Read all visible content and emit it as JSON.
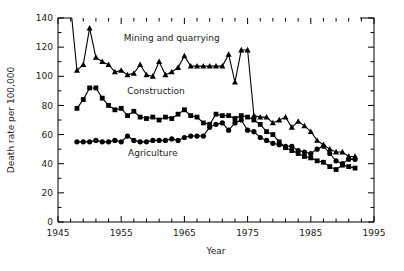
{
  "figure": {
    "background": "#ffffff",
    "ink": "#000000"
  },
  "chart_data": {
    "type": "line",
    "title": "",
    "subtitle": "",
    "xlabel": "Year",
    "ylabel": "Death rate per 100,000",
    "xlim": [
      1945,
      1995
    ],
    "ylim": [
      0,
      140
    ],
    "xticks": [
      1945,
      1955,
      1965,
      1975,
      1985,
      1995
    ],
    "xticklabels": [
      "1945",
      "1955",
      "1965",
      "1975",
      "1985",
      "1995"
    ],
    "yticks": [
      0,
      20,
      40,
      60,
      80,
      100,
      120,
      140
    ],
    "yticklabels": [
      "0",
      "20",
      "40",
      "60",
      "80",
      "100",
      "120",
      "140"
    ],
    "xminorticks": [
      1947,
      1949,
      1951,
      1953,
      1957,
      1959,
      1961,
      1963,
      1967,
      1969,
      1971,
      1973,
      1977,
      1979,
      1981,
      1983,
      1987,
      1989,
      1991,
      1993
    ],
    "yminorticks": [
      10,
      30,
      50,
      70,
      90,
      110,
      130
    ],
    "grid": false,
    "legend_position": "inline-annotations",
    "annotations": [
      {
        "text": "Mining and quarrying",
        "x": 1963.0,
        "y": 124.0
      },
      {
        "text": "Construction",
        "x": 1960.5,
        "y": 88.0
      },
      {
        "text": "Agriculture",
        "x": 1960.0,
        "y": 45.0
      }
    ],
    "series": [
      {
        "name": "Mining and quarrying",
        "marker": "triangle",
        "color": "#000000",
        "x": [
          1947,
          1948,
          1949,
          1950,
          1951,
          1952,
          1953,
          1954,
          1955,
          1956,
          1957,
          1958,
          1959,
          1960,
          1961,
          1962,
          1963,
          1964,
          1965,
          1966,
          1967,
          1968,
          1969,
          1970,
          1971,
          1972,
          1973,
          1974,
          1975,
          1976,
          1977,
          1978,
          1979,
          1980,
          1981,
          1982,
          1983,
          1984,
          1985,
          1986,
          1987,
          1988,
          1989,
          1990,
          1991,
          1992
        ],
        "values": [
          148,
          104,
          108,
          133,
          113,
          110,
          108,
          103,
          104,
          101,
          102,
          108,
          101,
          100,
          110,
          101,
          103,
          106,
          114,
          107,
          107,
          107,
          107,
          107,
          107,
          115,
          96,
          118,
          118,
          73,
          72,
          72,
          68,
          70,
          72,
          65,
          69,
          66,
          62,
          56,
          53,
          50,
          48,
          48,
          45,
          45
        ]
      },
      {
        "name": "Construction",
        "marker": "square",
        "color": "#000000",
        "x": [
          1948,
          1949,
          1950,
          1951,
          1952,
          1953,
          1954,
          1955,
          1956,
          1957,
          1958,
          1959,
          1960,
          1961,
          1962,
          1963,
          1964,
          1965,
          1966,
          1967,
          1968,
          1969,
          1970,
          1971,
          1972,
          1973,
          1974,
          1975,
          1976,
          1977,
          1978,
          1979,
          1980,
          1981,
          1982,
          1983,
          1984,
          1985,
          1986,
          1987,
          1988,
          1989,
          1990,
          1991,
          1992
        ],
        "values": [
          78,
          84,
          92,
          92,
          85,
          80,
          77,
          78,
          73,
          76,
          72,
          71,
          72,
          70,
          72,
          71,
          74,
          77,
          73,
          72,
          68,
          67,
          74,
          73,
          73,
          71,
          73,
          72,
          70,
          67,
          62,
          60,
          55,
          51,
          49,
          47,
          45,
          44,
          42,
          41,
          38,
          36,
          39,
          38,
          37
        ]
      },
      {
        "name": "Agriculture",
        "marker": "circle",
        "color": "#000000",
        "x": [
          1948,
          1949,
          1950,
          1951,
          1952,
          1953,
          1954,
          1955,
          1956,
          1957,
          1958,
          1959,
          1960,
          1961,
          1962,
          1963,
          1964,
          1965,
          1966,
          1967,
          1968,
          1969,
          1970,
          1971,
          1972,
          1973,
          1974,
          1975,
          1976,
          1977,
          1978,
          1979,
          1980,
          1981,
          1982,
          1983,
          1984,
          1985,
          1986,
          1987,
          1988,
          1989,
          1990,
          1991,
          1992
        ],
        "values": [
          55,
          55,
          55,
          56,
          55,
          55,
          56,
          55,
          59,
          56,
          55,
          55,
          56,
          56,
          56,
          57,
          56,
          58,
          59,
          59,
          59,
          65,
          67,
          68,
          63,
          68,
          70,
          63,
          62,
          58,
          56,
          54,
          53,
          52,
          52,
          49,
          48,
          47,
          50,
          52,
          47,
          42,
          40,
          43,
          43
        ]
      }
    ]
  }
}
